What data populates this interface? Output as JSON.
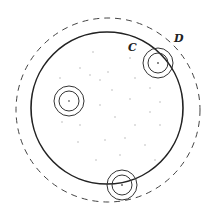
{
  "diagram": {
    "labels": {
      "c": "C",
      "d": "D"
    },
    "colors": {
      "stroke": "#222222",
      "dots": "#999999",
      "background": "#ffffff"
    },
    "circle_c": {
      "cx": 107,
      "cy": 108,
      "r": 76,
      "style": "solid"
    },
    "circle_d": {
      "cx": 108,
      "cy": 110,
      "r": 92,
      "style": "dashed"
    },
    "small_circles": [
      {
        "cx": 158,
        "cy": 63,
        "r_outer": 15,
        "r_inner": 10
      },
      {
        "cx": 69,
        "cy": 101,
        "r_outer": 15,
        "r_inner": 10
      },
      {
        "cx": 122,
        "cy": 185,
        "r_outer": 15,
        "r_inner": 10
      }
    ]
  }
}
